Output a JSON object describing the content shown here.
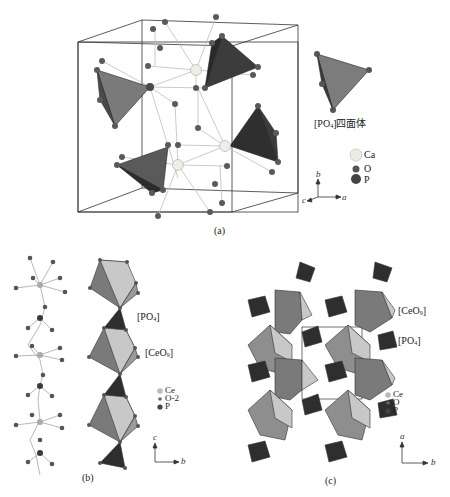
{
  "panels": {
    "a": {
      "caption": "(a)",
      "tetra_label_main": "[PO",
      "tetra_label_sub": "4",
      "tetra_label_tail": "]四面体",
      "legend": [
        {
          "symbol": "Ca",
          "label": "Ca",
          "color": "#e8e8e0",
          "size": 7
        },
        {
          "symbol": "O",
          "label": "O",
          "color": "#555555",
          "size": 4
        },
        {
          "symbol": "P",
          "label": "P",
          "color": "#444444",
          "size": 6
        }
      ],
      "axes": {
        "up": "b",
        "right": "a",
        "out": "c"
      }
    },
    "b": {
      "caption": "(b)",
      "label_po4_main": "[PO",
      "label_po4_sub": "4",
      "label_po4_tail": "]",
      "label_ceo9_main": "[CeO",
      "label_ceo9_sub": "9",
      "label_ceo9_tail": "]",
      "legend": [
        {
          "symbol": "Ce",
          "label": "Ce"
        },
        {
          "symbol": "O",
          "label": "O-2"
        },
        {
          "symbol": "P",
          "label": "P"
        }
      ],
      "axes": {
        "up": "c",
        "right": "b"
      }
    },
    "c": {
      "caption": "(c)",
      "label_ceo9_main": "[CeO",
      "label_ceo9_sub": "9",
      "label_ceo9_tail": "]",
      "label_po4_main": "[PO",
      "label_po4_sub": "4",
      "label_po4_tail": "]",
      "legend": [
        {
          "symbol": "Ce",
          "label": "Ce"
        },
        {
          "symbol": "O",
          "label": "O"
        },
        {
          "symbol": "P",
          "label": "P"
        }
      ],
      "axes": {
        "up": "a",
        "right": "b"
      }
    }
  },
  "colors": {
    "tetra_dark": "#3a3a3a",
    "tetra_mid": "#6e6e6e",
    "poly_light": "#c9c9c9",
    "poly_mid": "#8d8d8d",
    "atom_o": "#5a5a5a",
    "atom_ca": "#ececE4",
    "bond": "#b8b8b8",
    "cell_line": "#333333"
  }
}
